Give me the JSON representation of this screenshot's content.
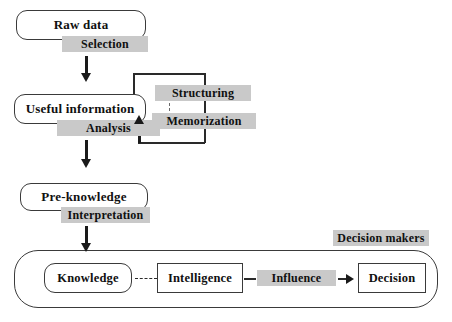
{
  "diagram": {
    "colors": {
      "band_fill": "#c9c9c9",
      "node_stroke": "#3a3a3a",
      "node_fill": "#ffffff",
      "line": "#2a2a2a",
      "text": "#101010",
      "background": "#ffffff"
    },
    "nodes": {
      "raw_data": "Raw data",
      "useful_information": "Useful information",
      "pre_knowledge": "Pre-knowledge",
      "knowledge": "Knowledge",
      "intelligence": "Intelligence",
      "decision": "Decision"
    },
    "process_bands": {
      "selection": "Selection",
      "analysis": "Analysis",
      "structuring": "Structuring",
      "memorization": "Memorization",
      "interpretation": "Interpretation",
      "influence": "Influence"
    },
    "group_label": "Decision makers"
  }
}
